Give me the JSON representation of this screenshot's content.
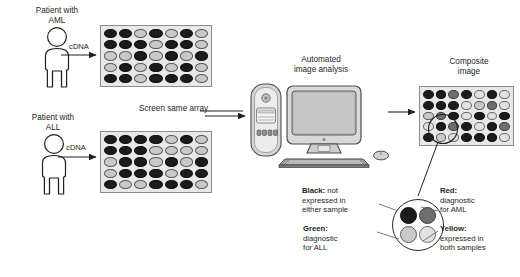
{
  "figure": {
    "type": "microarray-workflow-diagram",
    "patient_aml": {
      "label": "Patient with\nAML",
      "probe_label": "cDNA",
      "array_name": "aml-array"
    },
    "patient_all": {
      "label": "Patient with\nALL",
      "probe_label": "cDNA",
      "array_name": "all-array"
    },
    "screen_note": "Screen same array",
    "analysis": {
      "label": "Automated\nimage analysis"
    },
    "composite": {
      "label": "Composite\nimage"
    }
  },
  "legend": {
    "black": {
      "head": "Black:",
      "body": " not\nexpressed in\neither sample",
      "color": "#1b1b1b"
    },
    "red": {
      "head": "Red:",
      "body": "\ndiagnostic\nfor AML",
      "color": "#6e6e6e"
    },
    "green": {
      "head": "Green:",
      "body": "\ndiagnostic\nfor ALL",
      "color": "#a8a8a8"
    },
    "yellow": {
      "head": "Yellow:",
      "body": "\nexpressed in\nboth samples",
      "color": "#dcdcdc"
    }
  },
  "chart_data": {
    "type": "heatmap",
    "legend_position": "bottom-right",
    "shade_key": {
      "k": "black - not expressed in either sample",
      "d": "red - diagnostic for AML",
      "g": "green - diagnostic for ALL",
      "l": "yellow - expressed in both samples"
    },
    "panels": [
      {
        "name": "aml-array",
        "rows": 5,
        "cols": 7,
        "cells": [
          [
            "k",
            "k",
            "g",
            "k",
            "g",
            "k",
            "g"
          ],
          [
            "k",
            "k",
            "k",
            "g",
            "k",
            "k",
            "g"
          ],
          [
            "g",
            "g",
            "k",
            "g",
            "k",
            "g",
            "k"
          ],
          [
            "g",
            "k",
            "g",
            "k",
            "g",
            "k",
            "g"
          ],
          [
            "k",
            "k",
            "g",
            "k",
            "k",
            "k",
            "g"
          ]
        ]
      },
      {
        "name": "all-array",
        "rows": 5,
        "cols": 7,
        "cells": [
          [
            "k",
            "k",
            "k",
            "k",
            "g",
            "k",
            "g"
          ],
          [
            "k",
            "k",
            "k",
            "g",
            "g",
            "g",
            "g"
          ],
          [
            "g",
            "k",
            "k",
            "g",
            "k",
            "g",
            "k"
          ],
          [
            "g",
            "k",
            "k",
            "k",
            "g",
            "k",
            "k"
          ],
          [
            "k",
            "g",
            "g",
            "k",
            "k",
            "k",
            "g"
          ]
        ]
      },
      {
        "name": "composite-array",
        "rows": 5,
        "cols": 7,
        "cells": [
          [
            "k",
            "k",
            "d",
            "k",
            "l",
            "k",
            "l"
          ],
          [
            "k",
            "k",
            "k",
            "l",
            "g",
            "d",
            "l"
          ],
          [
            "g",
            "d",
            "k",
            "l",
            "k",
            "l",
            "k"
          ],
          [
            "l",
            "k",
            "d",
            "k",
            "l",
            "k",
            "d"
          ],
          [
            "k",
            "g",
            "l",
            "k",
            "k",
            "k",
            "l"
          ]
        ]
      }
    ],
    "magnifier": {
      "name": "composite-detail",
      "cells": [
        [
          "k",
          "d"
        ],
        [
          "g",
          "l"
        ]
      ]
    }
  }
}
